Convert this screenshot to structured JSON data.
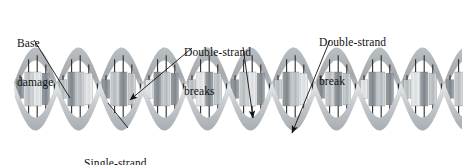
{
  "figure": {
    "type": "dna-damage-diagram",
    "background_color": "#ffffff",
    "canvas": {
      "width": 468,
      "height": 165
    },
    "helix": {
      "x_start": 14,
      "x_end": 462,
      "center_y": 89,
      "amplitude": 35,
      "period": 86,
      "ribbon_thickness": 13,
      "ribbon_color_front": "#c9cdd0",
      "ribbon_color_back": "#9aa0a4",
      "ribbon_color_light": "#e2e5e7",
      "base_pair_rod_color": "#2a2a2a",
      "base_block_colors": [
        "#8e9499",
        "#b8bdc1",
        "#d6d9db",
        "#6f767b"
      ]
    },
    "annotations": [
      {
        "id": "base-damage",
        "label_line_1": "Base",
        "label_line_2": "damage",
        "leader_from": {
          "x": 34,
          "y": 40
        },
        "leader_to": {
          "x": 70,
          "y": 98
        },
        "arrowhead": false
      },
      {
        "id": "double-strand-breaks",
        "label_line_1": "Double-strand",
        "label_line_2": "breaks",
        "leader_from": {
          "x": 192,
          "y": 48
        },
        "leader_to": {
          "x": 130,
          "y": 100
        },
        "arrowhead": true
      },
      {
        "id": "double-strand-breaks-2",
        "label_line_1": "",
        "label_line_2": "",
        "leader_from": {
          "x": 243,
          "y": 47
        },
        "leader_to": {
          "x": 253,
          "y": 118
        },
        "arrowhead": true
      },
      {
        "id": "double-strand-break",
        "label_line_1": "Double-strand",
        "label_line_2": "break",
        "leader_from": {
          "x": 330,
          "y": 40
        },
        "leader_to": {
          "x": 292,
          "y": 133
        },
        "arrowhead": true
      },
      {
        "id": "single-strand-break",
        "label_line_1": "Single-strand",
        "label_line_2": "break",
        "leader_from": {
          "x": 128,
          "y": 128
        },
        "leader_to": {
          "x": 108,
          "y": 103
        },
        "arrowhead": false
      }
    ]
  },
  "labels": {
    "base_damage": {
      "line1": "Base",
      "line2": "damage"
    },
    "double_strand_breaks": {
      "line1": "Double-strand",
      "line2": "breaks"
    },
    "double_strand_break": {
      "line1": "Double-strand",
      "line2": "break"
    },
    "single_strand_break": {
      "line1": "Single-strand",
      "line2": "break"
    }
  }
}
